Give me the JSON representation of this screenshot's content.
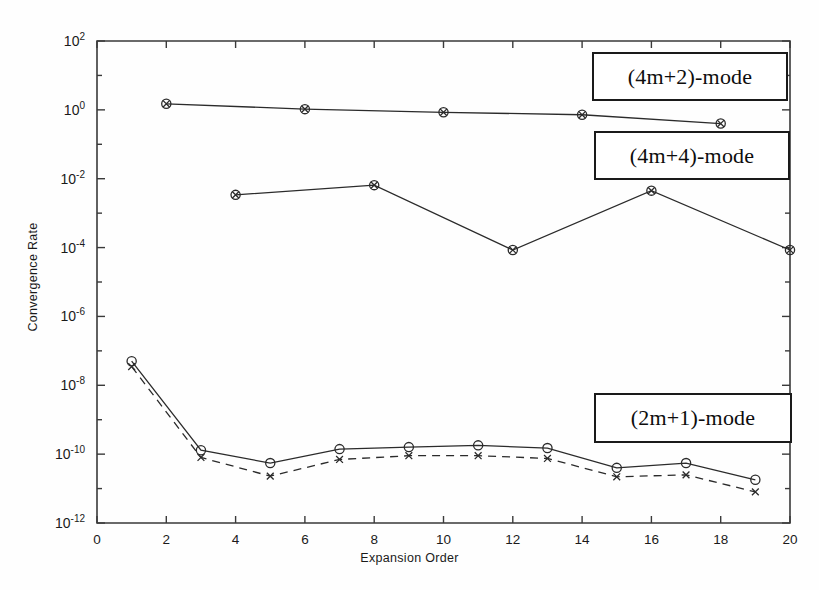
{
  "figure": {
    "background_color": "#fefefe",
    "axes_color": "#3a3a3a",
    "line_color": "#2b2b2b"
  },
  "axis_labels": {
    "x": "Expansion Order",
    "y": "Convergence Rate"
  },
  "legend": {
    "items": [
      {
        "id": "4m2",
        "label": "(4m+2)-mode"
      },
      {
        "id": "4m4",
        "label": "(4m+4)-mode"
      },
      {
        "id": "2m1",
        "label": "(2m+1)-mode"
      }
    ]
  },
  "x_ticks": [
    {
      "value": 0,
      "label": "0"
    },
    {
      "value": 2,
      "label": "2"
    },
    {
      "value": 4,
      "label": "4"
    },
    {
      "value": 6,
      "label": "6"
    },
    {
      "value": 8,
      "label": "8"
    },
    {
      "value": 10,
      "label": "10"
    },
    {
      "value": 12,
      "label": "12"
    },
    {
      "value": 14,
      "label": "14"
    },
    {
      "value": 16,
      "label": "16"
    },
    {
      "value": 18,
      "label": "18"
    },
    {
      "value": 20,
      "label": "20"
    }
  ],
  "y_ticks": [
    {
      "exp": 2,
      "label": "10",
      "sup": "2"
    },
    {
      "exp": 0,
      "label": "10",
      "sup": "0"
    },
    {
      "exp": -2,
      "label": "10",
      "sup": "-2"
    },
    {
      "exp": -4,
      "label": "10",
      "sup": "-4"
    },
    {
      "exp": -6,
      "label": "10",
      "sup": "-6"
    },
    {
      "exp": -8,
      "label": "10",
      "sup": "-8"
    },
    {
      "exp": -10,
      "label": "10",
      "sup": "-10"
    },
    {
      "exp": -12,
      "label": "10",
      "sup": "-12"
    }
  ],
  "chart_data": {
    "type": "line",
    "title": "",
    "xlabel": "Expansion Order",
    "ylabel": "Convergence Rate",
    "xlim": [
      0,
      20
    ],
    "ylim": [
      1e-12,
      100
    ],
    "yscale": "log",
    "xscale": "linear",
    "grid": false,
    "legend_position": "inside-boxes",
    "series": [
      {
        "name": "(4m+2)-mode",
        "marker": "circle-x",
        "linestyle": "solid",
        "x": [
          2,
          6,
          10,
          14,
          18
        ],
        "y": [
          1.5,
          1.05,
          0.85,
          0.72,
          0.4
        ]
      },
      {
        "name": "(4m+4)-mode",
        "marker": "circle-x",
        "linestyle": "solid",
        "x": [
          4,
          8,
          12,
          16,
          20
        ],
        "y": [
          0.0034,
          0.0065,
          8.5e-05,
          0.0045,
          8.5e-05
        ]
      },
      {
        "name": "(2m+1)-mode solid",
        "marker": "circle",
        "linestyle": "solid",
        "x": [
          1,
          3,
          5,
          7,
          9,
          11,
          13,
          15,
          17,
          19
        ],
        "y": [
          5e-08,
          1.3e-10,
          5.5e-11,
          1.4e-10,
          1.6e-10,
          1.8e-10,
          1.5e-10,
          4e-11,
          5.5e-11,
          1.8e-11
        ]
      },
      {
        "name": "(2m+1)-mode dashed",
        "marker": "x",
        "linestyle": "dashed",
        "x": [
          1,
          3,
          5,
          7,
          9,
          11,
          13,
          15,
          17,
          19
        ],
        "y": [
          3.5e-08,
          8e-11,
          2.3e-11,
          7e-11,
          9e-11,
          9e-11,
          7.5e-11,
          2.2e-11,
          2.5e-11,
          8e-12
        ]
      }
    ]
  }
}
